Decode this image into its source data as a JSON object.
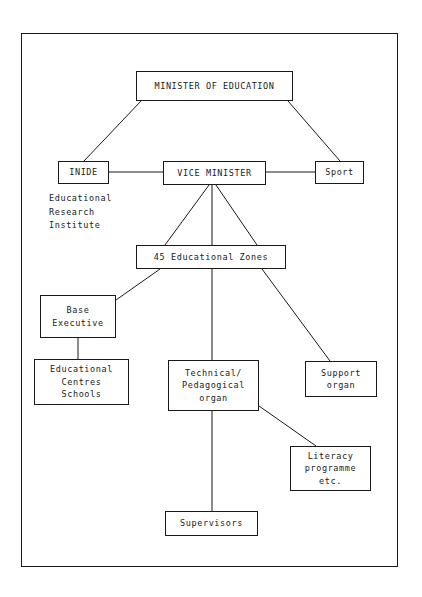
{
  "diagram": {
    "type": "organizational-chart",
    "nodes": {
      "minister": "MINISTER OF EDUCATION",
      "inide": "INIDE",
      "vice_minister": "VICE MINISTER",
      "sport": "Sport",
      "zones": "45 Educational Zones",
      "base_executive": "Base\nExecutive",
      "educational_centres": "Educational\nCentres\nSchools",
      "technical_pedagogical": "Technical/\nPedagogical\norgan",
      "support_organ": "Support\norgan",
      "literacy": "Literacy\nprogramme\netc.",
      "supervisors": "Supervisors"
    },
    "captions": {
      "inide_expansion": "Educational\nResearch\nInstitute"
    },
    "edges": [
      {
        "from": "minister",
        "to": "inide"
      },
      {
        "from": "minister",
        "to": "sport"
      },
      {
        "from": "inide",
        "to": "vice_minister"
      },
      {
        "from": "vice_minister",
        "to": "sport"
      },
      {
        "from": "vice_minister",
        "to": "zones",
        "style": "fan-left"
      },
      {
        "from": "vice_minister",
        "to": "zones",
        "style": "fan-center"
      },
      {
        "from": "vice_minister",
        "to": "zones",
        "style": "fan-right"
      },
      {
        "from": "zones",
        "to": "base_executive"
      },
      {
        "from": "zones",
        "to": "technical_pedagogical"
      },
      {
        "from": "zones",
        "to": "support_organ"
      },
      {
        "from": "base_executive",
        "to": "educational_centres"
      },
      {
        "from": "technical_pedagogical",
        "to": "literacy"
      },
      {
        "from": "technical_pedagogical",
        "to": "supervisors"
      }
    ],
    "colors": {
      "ink": "#1a1a1a",
      "background": "#ffffff"
    }
  }
}
